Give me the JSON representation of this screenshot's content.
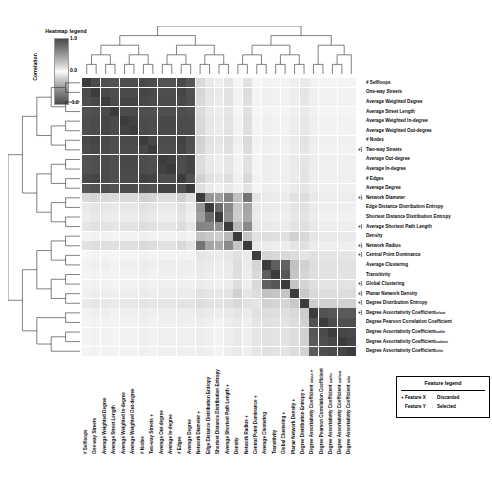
{
  "heatmap_legend": {
    "title": "Heatmap legend",
    "axis_label": "Correlation",
    "ticks": [
      "1.0",
      "0.0",
      "-1.0"
    ]
  },
  "feature_legend": {
    "title": "Feature legend",
    "rows": [
      {
        "feature": "Feature X",
        "arrow": "→",
        "status": "Discarded"
      },
      {
        "feature": "Feature Y",
        "arrow": "→",
        "status": "Selected"
      }
    ]
  },
  "chart_data": {
    "type": "heatmap",
    "title": "",
    "xlabel": "",
    "ylabel": "",
    "colorbar_label": "Correlation",
    "zlim": [
      -1.0,
      1.0
    ],
    "colormap": "gray_r diverging (white at 0, dark at |1|)",
    "grid": true,
    "legend_position": "bottom-right",
    "row_dendrogram": true,
    "column_dendrogram": true,
    "annotations": [
      "marked rows/columns carry a '+' glyph indicating Discarded features",
      "unmarked rows/columns indicate Selected features"
    ],
    "labels": [
      "# Selfloops",
      "One-way Streets",
      "Average Weighted Degree",
      "Average Street Length",
      "Average Weighted In-degree",
      "Average Weighted Out-degree",
      "# Nodes",
      "Two-way Streets",
      "Average Out-degree",
      "Average In-degree",
      "# Edges",
      "Average Degree",
      "Network Diameter",
      "Edge Distance Distribution Entropy",
      "Shortest Distance Distribution Entropy",
      "Average Shortest Path Length",
      "Density",
      "Network Radius",
      "Central Point Dominance",
      "Average Clustering",
      "Transitivity",
      "Global Clustering",
      "Planar Network Density",
      "Degree Distribution Entropy",
      "Degree Assortativity Coefficient in/out",
      "Degree Pearson Correlation Coefficient",
      "Degree Assortativity Coefficient out/in",
      "Degree Assortativity Coefficient out/out",
      "Degree Assortativity Coefficient in/in"
    ],
    "label_subscripts": [
      "",
      "",
      "",
      "",
      "",
      "",
      "",
      "",
      "",
      "",
      "",
      "",
      "",
      "",
      "",
      "",
      "",
      "",
      "",
      "",
      "",
      "",
      "",
      "",
      "in/out",
      "",
      "out/in",
      "out/out",
      "in/in"
    ],
    "label_bases": [
      "# Selfloops",
      "One-way Streets",
      "Average Weighted Degree",
      "Average Street Length",
      "Average Weighted In-degree",
      "Average Weighted Out-degree",
      "# Nodes",
      "Two-way Streets",
      "Average Out-degree",
      "Average In-degree",
      "# Edges",
      "Average Degree",
      "Network Diameter",
      "Edge Distance Distribution Entropy",
      "Shortest Distance Distribution Entropy",
      "Average Shortest Path Length",
      "Density",
      "Network Radius",
      "Central Point Dominance",
      "Average Clustering",
      "Transitivity",
      "Global Clustering",
      "Planar Network Density",
      "Degree Distribution Entropy",
      "Degree Assortativity Coefficient ",
      "Degree Pearson Correlation Coefficient",
      "Degree Assortativity Coefficient ",
      "Degree Assortativity Coefficient ",
      "Degree Assortativity Coefficient "
    ],
    "discarded_flags": [
      false,
      false,
      false,
      false,
      false,
      false,
      false,
      true,
      false,
      false,
      false,
      false,
      true,
      false,
      false,
      true,
      false,
      true,
      true,
      false,
      false,
      true,
      true,
      true,
      true,
      false,
      false,
      false,
      false
    ],
    "matrix": [
      [
        1.0,
        0.92,
        0.9,
        0.88,
        0.9,
        0.9,
        0.93,
        0.91,
        0.88,
        0.88,
        0.93,
        0.86,
        0.18,
        0.1,
        0.08,
        0.12,
        0.05,
        0.14,
        0.04,
        0.06,
        0.05,
        0.05,
        0.07,
        0.1,
        0.06,
        0.05,
        0.05,
        0.05,
        0.05
      ],
      [
        0.92,
        1.0,
        0.93,
        0.9,
        0.92,
        0.92,
        0.95,
        0.93,
        0.9,
        0.9,
        0.95,
        0.88,
        0.2,
        0.12,
        0.1,
        0.14,
        0.06,
        0.16,
        0.05,
        0.07,
        0.06,
        0.06,
        0.08,
        0.12,
        0.07,
        0.06,
        0.06,
        0.06,
        0.06
      ],
      [
        0.9,
        0.93,
        1.0,
        0.92,
        0.95,
        0.95,
        0.93,
        0.92,
        0.92,
        0.92,
        0.93,
        0.9,
        0.18,
        0.11,
        0.09,
        0.13,
        0.06,
        0.15,
        0.05,
        0.07,
        0.06,
        0.06,
        0.08,
        0.11,
        0.07,
        0.06,
        0.06,
        0.06,
        0.06
      ],
      [
        0.88,
        0.9,
        0.92,
        1.0,
        0.92,
        0.92,
        0.9,
        0.9,
        0.9,
        0.9,
        0.9,
        0.88,
        0.17,
        0.1,
        0.08,
        0.12,
        0.05,
        0.14,
        0.04,
        0.06,
        0.05,
        0.05,
        0.07,
        0.1,
        0.06,
        0.05,
        0.05,
        0.05,
        0.05
      ],
      [
        0.9,
        0.92,
        0.95,
        0.92,
        1.0,
        0.96,
        0.92,
        0.91,
        0.93,
        0.93,
        0.92,
        0.91,
        0.18,
        0.11,
        0.09,
        0.13,
        0.06,
        0.15,
        0.05,
        0.07,
        0.06,
        0.06,
        0.08,
        0.11,
        0.07,
        0.06,
        0.06,
        0.06,
        0.06
      ],
      [
        0.9,
        0.92,
        0.95,
        0.92,
        0.96,
        1.0,
        0.92,
        0.91,
        0.93,
        0.93,
        0.92,
        0.91,
        0.18,
        0.11,
        0.09,
        0.13,
        0.06,
        0.15,
        0.05,
        0.07,
        0.06,
        0.06,
        0.08,
        0.11,
        0.07,
        0.06,
        0.06,
        0.06,
        0.06
      ],
      [
        0.93,
        0.95,
        0.93,
        0.9,
        0.92,
        0.92,
        1.0,
        0.94,
        0.91,
        0.91,
        0.97,
        0.89,
        0.22,
        0.14,
        0.12,
        0.16,
        0.07,
        0.18,
        0.06,
        0.08,
        0.07,
        0.07,
        0.09,
        0.13,
        0.08,
        0.07,
        0.07,
        0.07,
        0.07
      ],
      [
        0.91,
        0.93,
        0.92,
        0.9,
        0.91,
        0.91,
        0.94,
        1.0,
        0.9,
        0.9,
        0.95,
        0.88,
        0.2,
        0.12,
        0.1,
        0.14,
        0.06,
        0.16,
        0.05,
        0.07,
        0.06,
        0.06,
        0.08,
        0.12,
        0.07,
        0.06,
        0.06,
        0.06,
        0.06
      ],
      [
        0.88,
        0.9,
        0.92,
        0.9,
        0.93,
        0.93,
        0.91,
        0.9,
        1.0,
        0.97,
        0.91,
        0.95,
        0.16,
        0.1,
        0.08,
        0.12,
        0.06,
        0.14,
        0.05,
        0.08,
        0.07,
        0.07,
        0.09,
        0.12,
        0.08,
        0.07,
        0.07,
        0.07,
        0.07
      ],
      [
        0.88,
        0.9,
        0.92,
        0.9,
        0.93,
        0.93,
        0.91,
        0.9,
        0.97,
        1.0,
        0.91,
        0.95,
        0.16,
        0.1,
        0.08,
        0.12,
        0.06,
        0.14,
        0.05,
        0.08,
        0.07,
        0.07,
        0.09,
        0.12,
        0.08,
        0.07,
        0.07,
        0.07,
        0.07
      ],
      [
        0.93,
        0.95,
        0.93,
        0.9,
        0.92,
        0.92,
        0.97,
        0.95,
        0.91,
        0.91,
        1.0,
        0.89,
        0.22,
        0.14,
        0.12,
        0.16,
        0.07,
        0.18,
        0.06,
        0.08,
        0.07,
        0.07,
        0.09,
        0.13,
        0.08,
        0.07,
        0.07,
        0.07,
        0.07
      ],
      [
        0.86,
        0.88,
        0.9,
        0.88,
        0.91,
        0.91,
        0.89,
        0.88,
        0.95,
        0.95,
        0.89,
        1.0,
        0.15,
        0.09,
        0.07,
        0.11,
        0.06,
        0.13,
        0.05,
        0.08,
        0.07,
        0.07,
        0.09,
        0.12,
        0.08,
        0.07,
        0.07,
        0.07,
        0.07
      ],
      [
        0.18,
        0.2,
        0.18,
        0.17,
        0.18,
        0.18,
        0.22,
        0.2,
        0.16,
        0.16,
        0.22,
        0.15,
        1.0,
        0.52,
        0.48,
        0.62,
        0.3,
        0.7,
        0.12,
        0.1,
        0.09,
        0.09,
        0.14,
        0.16,
        0.1,
        0.08,
        0.08,
        0.08,
        0.08
      ],
      [
        0.1,
        0.12,
        0.11,
        0.1,
        0.11,
        0.11,
        0.14,
        0.12,
        0.1,
        0.1,
        0.14,
        0.09,
        0.52,
        1.0,
        0.75,
        0.6,
        0.26,
        0.45,
        0.1,
        0.09,
        0.08,
        0.08,
        0.12,
        0.14,
        0.09,
        0.07,
        0.07,
        0.07,
        0.07
      ],
      [
        0.08,
        0.1,
        0.09,
        0.08,
        0.09,
        0.09,
        0.12,
        0.1,
        0.08,
        0.08,
        0.12,
        0.07,
        0.48,
        0.75,
        1.0,
        0.56,
        0.24,
        0.42,
        0.09,
        0.08,
        0.07,
        0.07,
        0.11,
        0.13,
        0.08,
        0.06,
        0.06,
        0.06,
        0.06
      ],
      [
        0.12,
        0.14,
        0.13,
        0.12,
        0.13,
        0.13,
        0.16,
        0.14,
        0.12,
        0.12,
        0.16,
        0.11,
        0.62,
        0.6,
        0.56,
        1.0,
        0.34,
        0.58,
        0.11,
        0.1,
        0.09,
        0.09,
        0.13,
        0.15,
        0.1,
        0.08,
        0.08,
        0.08,
        0.08
      ],
      [
        0.05,
        0.06,
        0.06,
        0.05,
        0.06,
        0.06,
        0.07,
        0.06,
        0.06,
        0.06,
        0.07,
        0.06,
        0.3,
        0.26,
        0.24,
        0.34,
        1.0,
        0.28,
        0.14,
        0.16,
        0.15,
        0.15,
        0.22,
        0.18,
        0.12,
        0.1,
        0.1,
        0.1,
        0.1
      ],
      [
        0.14,
        0.16,
        0.15,
        0.14,
        0.15,
        0.15,
        0.18,
        0.16,
        0.14,
        0.14,
        0.18,
        0.13,
        0.7,
        0.45,
        0.42,
        0.58,
        0.28,
        1.0,
        0.1,
        0.09,
        0.08,
        0.08,
        0.12,
        0.14,
        0.09,
        0.07,
        0.07,
        0.07,
        0.07
      ],
      [
        0.04,
        0.05,
        0.05,
        0.04,
        0.05,
        0.05,
        0.06,
        0.05,
        0.05,
        0.05,
        0.06,
        0.05,
        0.12,
        0.1,
        0.09,
        0.11,
        0.14,
        0.1,
        1.0,
        0.2,
        0.18,
        0.18,
        0.16,
        0.12,
        0.14,
        0.12,
        0.12,
        0.12,
        0.12
      ],
      [
        0.06,
        0.07,
        0.07,
        0.06,
        0.07,
        0.07,
        0.08,
        0.07,
        0.08,
        0.08,
        0.08,
        0.08,
        0.1,
        0.09,
        0.08,
        0.1,
        0.16,
        0.09,
        0.2,
        1.0,
        0.82,
        0.8,
        0.3,
        0.22,
        0.16,
        0.14,
        0.14,
        0.14,
        0.14
      ],
      [
        0.05,
        0.06,
        0.06,
        0.05,
        0.06,
        0.06,
        0.07,
        0.06,
        0.07,
        0.07,
        0.07,
        0.07,
        0.09,
        0.08,
        0.07,
        0.09,
        0.15,
        0.08,
        0.18,
        0.82,
        1.0,
        0.86,
        0.28,
        0.2,
        0.15,
        0.13,
        0.13,
        0.13,
        0.13
      ],
      [
        0.05,
        0.06,
        0.06,
        0.05,
        0.06,
        0.06,
        0.07,
        0.06,
        0.07,
        0.07,
        0.07,
        0.07,
        0.09,
        0.08,
        0.07,
        0.09,
        0.15,
        0.08,
        0.18,
        0.8,
        0.86,
        1.0,
        0.28,
        0.2,
        0.15,
        0.13,
        0.13,
        0.13,
        0.13
      ],
      [
        0.07,
        0.08,
        0.08,
        0.07,
        0.08,
        0.08,
        0.09,
        0.08,
        0.09,
        0.09,
        0.09,
        0.09,
        0.14,
        0.12,
        0.11,
        0.13,
        0.22,
        0.12,
        0.16,
        0.3,
        0.28,
        0.28,
        1.0,
        0.26,
        0.18,
        0.16,
        0.16,
        0.16,
        0.16
      ],
      [
        0.1,
        0.12,
        0.11,
        0.1,
        0.11,
        0.11,
        0.13,
        0.12,
        0.12,
        0.12,
        0.13,
        0.12,
        0.16,
        0.14,
        0.13,
        0.15,
        0.18,
        0.14,
        0.12,
        0.22,
        0.2,
        0.2,
        0.26,
        1.0,
        0.24,
        0.22,
        0.22,
        0.22,
        0.22
      ],
      [
        0.06,
        0.07,
        0.07,
        0.06,
        0.07,
        0.07,
        0.08,
        0.07,
        0.08,
        0.08,
        0.08,
        0.08,
        0.1,
        0.09,
        0.08,
        0.1,
        0.12,
        0.09,
        0.14,
        0.16,
        0.15,
        0.15,
        0.18,
        0.24,
        1.0,
        0.88,
        0.86,
        0.84,
        0.84
      ],
      [
        0.05,
        0.06,
        0.06,
        0.05,
        0.06,
        0.06,
        0.07,
        0.06,
        0.07,
        0.07,
        0.07,
        0.07,
        0.08,
        0.07,
        0.06,
        0.08,
        0.1,
        0.07,
        0.12,
        0.14,
        0.13,
        0.13,
        0.16,
        0.22,
        0.88,
        1.0,
        0.92,
        0.9,
        0.9
      ],
      [
        0.05,
        0.06,
        0.06,
        0.05,
        0.06,
        0.06,
        0.07,
        0.06,
        0.07,
        0.07,
        0.07,
        0.07,
        0.08,
        0.07,
        0.06,
        0.08,
        0.1,
        0.07,
        0.12,
        0.14,
        0.13,
        0.13,
        0.16,
        0.22,
        0.86,
        0.92,
        1.0,
        0.94,
        0.93
      ],
      [
        0.05,
        0.06,
        0.06,
        0.05,
        0.06,
        0.06,
        0.07,
        0.06,
        0.07,
        0.07,
        0.07,
        0.07,
        0.08,
        0.07,
        0.06,
        0.08,
        0.1,
        0.07,
        0.12,
        0.14,
        0.13,
        0.13,
        0.16,
        0.22,
        0.84,
        0.9,
        0.94,
        1.0,
        0.95
      ],
      [
        0.05,
        0.06,
        0.06,
        0.05,
        0.06,
        0.06,
        0.07,
        0.06,
        0.07,
        0.07,
        0.07,
        0.07,
        0.08,
        0.07,
        0.06,
        0.08,
        0.1,
        0.07,
        0.12,
        0.14,
        0.13,
        0.13,
        0.16,
        0.22,
        0.84,
        0.9,
        0.93,
        0.95,
        1.0
      ]
    ],
    "column_dendrogram_links": [
      [
        0,
        1,
        0.3
      ],
      [
        2,
        3,
        0.28
      ],
      [
        4,
        5,
        0.22
      ],
      [
        6,
        7,
        0.26
      ],
      [
        8,
        9,
        0.2
      ],
      [
        10,
        11,
        0.24
      ],
      [
        12,
        13,
        0.55
      ],
      [
        14,
        15,
        0.5
      ],
      [
        16,
        17,
        0.58
      ],
      [
        18,
        19,
        0.6
      ],
      [
        20,
        21,
        0.45
      ],
      [
        22,
        23,
        0.62
      ],
      [
        24,
        25,
        0.35
      ],
      [
        26,
        27,
        0.3
      ],
      [
        27,
        28,
        0.4
      ]
    ],
    "row_dendrogram_links": [
      [
        0,
        1,
        0.3
      ],
      [
        2,
        3,
        0.28
      ],
      [
        4,
        5,
        0.22
      ],
      [
        6,
        7,
        0.26
      ],
      [
        8,
        9,
        0.2
      ],
      [
        10,
        11,
        0.24
      ],
      [
        12,
        13,
        0.55
      ],
      [
        14,
        15,
        0.5
      ],
      [
        16,
        17,
        0.58
      ],
      [
        18,
        19,
        0.6
      ],
      [
        20,
        21,
        0.45
      ],
      [
        22,
        23,
        0.62
      ],
      [
        24,
        25,
        0.35
      ],
      [
        26,
        27,
        0.3
      ],
      [
        27,
        28,
        0.4
      ]
    ]
  }
}
